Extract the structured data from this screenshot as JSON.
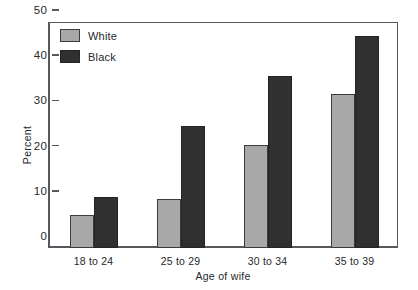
{
  "chart_data": {
    "type": "bar",
    "title": "",
    "xlabel": "Age of wife",
    "ylabel": "Percent",
    "categories": [
      "18 to 24",
      "25 to 29",
      "30 to 34",
      "35 to 39"
    ],
    "series": [
      {
        "name": "White",
        "color": "#a8a8a8",
        "values": [
          7.3,
          10.9,
          22.7,
          34.0
        ]
      },
      {
        "name": "Black",
        "color": "#303030",
        "values": [
          11.2,
          27.0,
          38.0,
          47.0
        ]
      }
    ],
    "ylim": [
      0,
      50
    ],
    "yticks": [
      0,
      10,
      20,
      30,
      40,
      50
    ],
    "ytick_labels": [
      "0",
      "10",
      "20",
      "30",
      "40",
      "50"
    ],
    "grid": false,
    "legend_position": "top-left"
  },
  "legend": {
    "items": [
      {
        "label": "White",
        "color": "#a8a8a8"
      },
      {
        "label": "Black",
        "color": "#303030"
      }
    ]
  }
}
